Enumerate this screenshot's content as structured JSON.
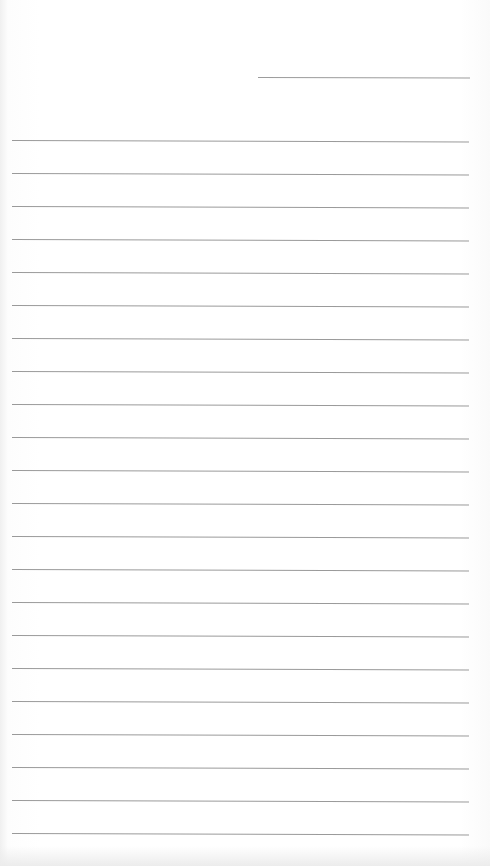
{
  "document": {
    "type": "lined-paper",
    "header_line": {
      "x": 258,
      "y": 77,
      "width": 212
    },
    "rules": {
      "count": 22,
      "first_y": 140,
      "spacing": 33,
      "left": 12,
      "width": 457
    },
    "colors": {
      "paper": "#ffffff",
      "rule": "#9a9a9a"
    }
  }
}
